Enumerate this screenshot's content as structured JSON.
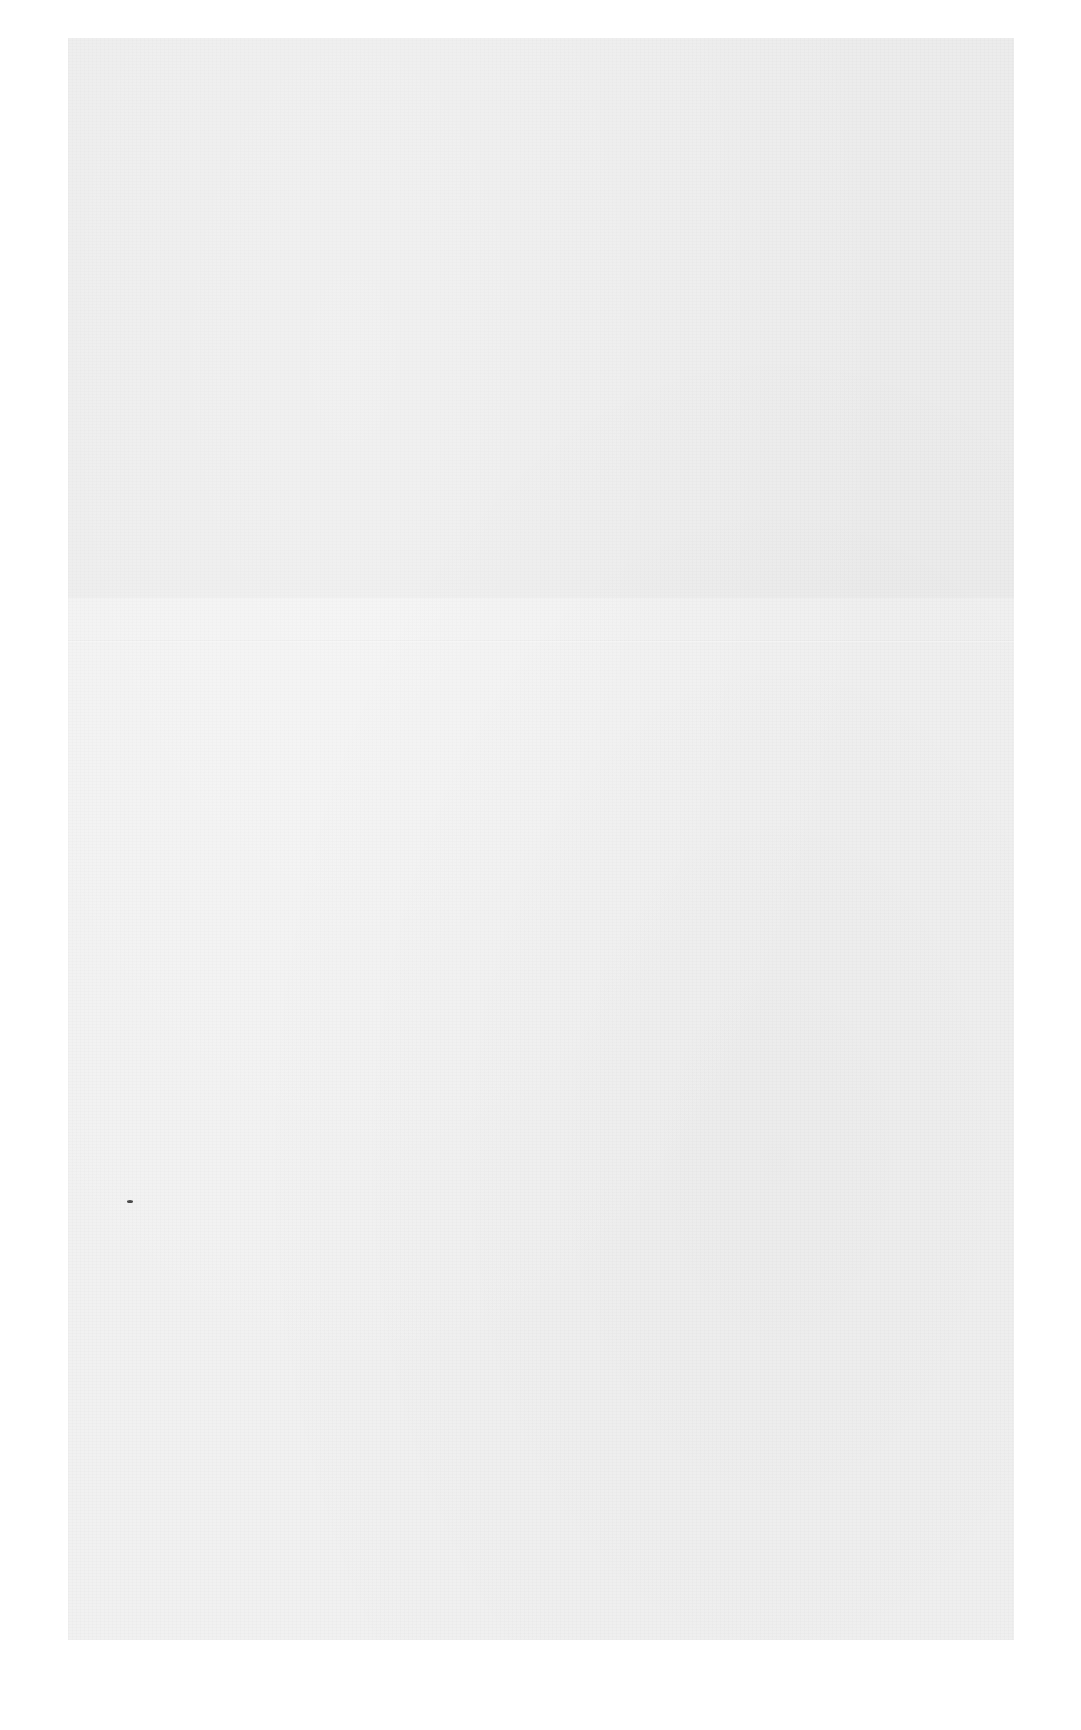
{
  "document": {
    "type": "blank scanned page",
    "text": "",
    "paper_color": "#f1f1f1",
    "background_color": "#ffffff",
    "paper_bounds": {
      "left": 68,
      "top": 38,
      "width": 946,
      "height": 1602
    },
    "marks": [
      {
        "kind": "fold-line",
        "y": 602
      },
      {
        "kind": "speck",
        "x": 59,
        "y": 1162
      }
    ]
  }
}
